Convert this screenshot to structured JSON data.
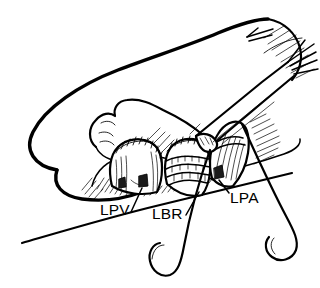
{
  "figure": {
    "kind": "surgical-line-illustration",
    "background_color": "#ffffff",
    "ink_color": "#000000",
    "width": 320,
    "height": 288
  },
  "labels": [
    {
      "id": "lpv",
      "text": "LPV",
      "meaning": "left pulmonary vein",
      "x": 100,
      "y": 215,
      "leader": "M 131 212 L 142 188"
    },
    {
      "id": "lbr",
      "text": "LBR",
      "meaning": "left bronchus",
      "x": 152,
      "y": 219,
      "leader": "M 186 215 L 199 192"
    },
    {
      "id": "lpa",
      "text": "LPA",
      "meaning": "left pulmonary artery",
      "x": 230,
      "y": 203,
      "leader": "M 229 193 L 219 180"
    }
  ],
  "structures": [
    {
      "id": "retracted-lung",
      "name": "retracted lung parenchyma"
    },
    {
      "id": "stapled-vein-stump",
      "name": "stapled pulmonary vein stump"
    },
    {
      "id": "bronchus-rings",
      "name": "bronchus with cartilage rings"
    },
    {
      "id": "artery-stump",
      "name": "pulmonary artery stump"
    },
    {
      "id": "forceps",
      "name": "forceps clamp"
    },
    {
      "id": "hook-center",
      "name": "curved retractor hook (center)"
    },
    {
      "id": "hook-right",
      "name": "curved retractor hook (right)"
    },
    {
      "id": "chest-wall",
      "name": "chest wall margin"
    }
  ]
}
